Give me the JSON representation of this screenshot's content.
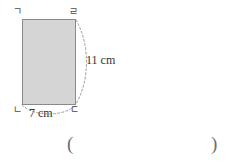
{
  "figure": {
    "type": "rectangle-with-dimension-arcs",
    "shape": {
      "name": "rectangle",
      "fill_color": "#d5d5d5",
      "stroke_color": "#8a8a8a",
      "x": 22,
      "y": 19,
      "width": 53,
      "height": 85
    },
    "vertex_labels": {
      "top_left": "ㄱ",
      "top_right": "ㄹ",
      "bottom_left": "ㄴ",
      "bottom_right": "ㄷ"
    },
    "dimensions": [
      {
        "id": "height",
        "label": "11 cm",
        "value": 11,
        "unit": "cm",
        "side": "right",
        "arc": "dashed"
      },
      {
        "id": "width",
        "label": "7 cm",
        "value": 7,
        "unit": "cm",
        "side": "bottom",
        "arc": "dashed"
      }
    ],
    "arc_color": "#9a9a9a"
  },
  "answer_blank": {
    "open_paren": "(",
    "close_paren": ")"
  }
}
